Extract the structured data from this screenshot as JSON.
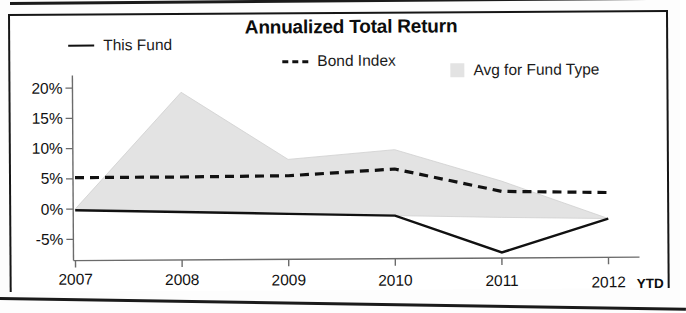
{
  "chart_data": {
    "type": "line",
    "title": "Annualized Total Return",
    "xlabel": "",
    "ylabel": "",
    "x_note": "YTD",
    "categories": [
      "2007",
      "2008",
      "2009",
      "2010",
      "2011",
      "2012"
    ],
    "ytick_labels": [
      "20%",
      "15%",
      "10%",
      "5%",
      "0%",
      "-5%"
    ],
    "ytick_values": [
      20,
      15,
      10,
      5,
      0,
      -5
    ],
    "ylim": [
      -9,
      21
    ],
    "grid": false,
    "legend_position": "top",
    "series": [
      {
        "name": "This Fund",
        "style": "solid",
        "color": "#111111",
        "values": [
          -0.2,
          -0.6,
          -1.0,
          -1.4,
          -7.6,
          -2.1
        ]
      },
      {
        "name": "Bond Index",
        "style": "dashed",
        "color": "#111111",
        "values": [
          5.2,
          5.2,
          5.3,
          6.3,
          2.5,
          2.2
        ]
      },
      {
        "name": "Avg for Fund Type",
        "style": "area-band",
        "color": "#e3e3e3",
        "upper": [
          0.0,
          19.2,
          8.0,
          9.5,
          4.2,
          -2.1
        ],
        "lower": [
          -0.2,
          -0.6,
          -1.0,
          -1.4,
          -1.8,
          -2.1
        ]
      }
    ]
  },
  "chart": {
    "title": "Annualized Total Return",
    "legend": [
      {
        "label": "This Fund",
        "marker": "solid-line"
      },
      {
        "label": "Bond Index",
        "marker": "dashed-line"
      },
      {
        "label": "Avg for Fund Type",
        "marker": "area-swatch"
      }
    ],
    "ytick_labels": [
      "20%",
      "15%",
      "10%",
      "5%",
      "0%",
      "-5%"
    ],
    "xtick_labels": [
      "2007",
      "2008",
      "2009",
      "2010",
      "2011",
      "2012"
    ],
    "ytd_label": "YTD"
  },
  "colors": {
    "line": "#111111",
    "area": "#e3e3e3",
    "axis": "#6b6b6b",
    "text": "#111111"
  }
}
